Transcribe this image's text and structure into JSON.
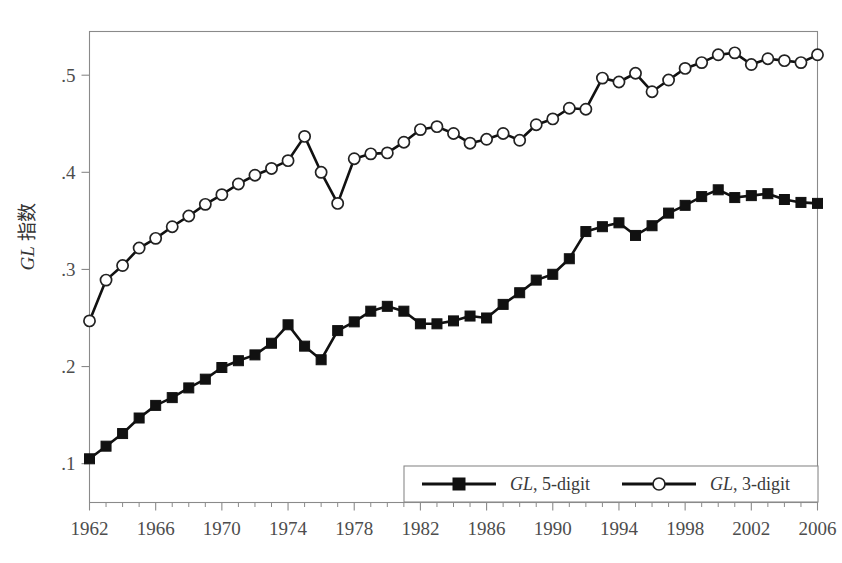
{
  "chart_data": {
    "type": "line",
    "title": "",
    "subtitle": "",
    "xlabel": "",
    "ylabel": "GL 指数",
    "ylabel_parts": {
      "italic": "GL",
      "plain": " 指数"
    },
    "xlim": [
      1962,
      2006
    ],
    "ylim": [
      0.06,
      0.545
    ],
    "grid": false,
    "legend_position": "bottom-right",
    "x_tick_labels": [
      "1962",
      "1966",
      "1970",
      "1974",
      "1978",
      "1982",
      "1986",
      "1990",
      "1994",
      "1998",
      "2002",
      "2006"
    ],
    "x_tick_values": [
      1962,
      1966,
      1970,
      1974,
      1978,
      1982,
      1986,
      1990,
      1994,
      1998,
      2002,
      2006
    ],
    "x_minor_step": 1,
    "y_tick_labels": [
      ".1",
      ".2",
      ".3",
      ".4",
      ".5"
    ],
    "y_tick_values": [
      0.1,
      0.2,
      0.3,
      0.4,
      0.5
    ],
    "x": [
      1962,
      1963,
      1964,
      1965,
      1966,
      1967,
      1968,
      1969,
      1970,
      1971,
      1972,
      1973,
      1974,
      1975,
      1976,
      1977,
      1978,
      1979,
      1980,
      1981,
      1982,
      1983,
      1984,
      1985,
      1986,
      1987,
      1988,
      1989,
      1990,
      1991,
      1992,
      1993,
      1994,
      1995,
      1996,
      1997,
      1998,
      1999,
      2000,
      2001,
      2002,
      2003,
      2004,
      2005,
      2006
    ],
    "series": [
      {
        "name": "GL, 5-digit",
        "marker": "filled-square",
        "color": "#111111",
        "values": [
          0.105,
          0.118,
          0.131,
          0.147,
          0.16,
          0.168,
          0.178,
          0.187,
          0.199,
          0.206,
          0.212,
          0.224,
          0.243,
          0.221,
          0.207,
          0.237,
          0.246,
          0.257,
          0.262,
          0.257,
          0.244,
          0.244,
          0.247,
          0.252,
          0.25,
          0.264,
          0.276,
          0.289,
          0.295,
          0.311,
          0.339,
          0.344,
          0.348,
          0.335,
          0.345,
          0.358,
          0.366,
          0.375,
          0.382,
          0.374,
          0.376,
          0.378,
          0.372,
          0.369,
          0.368
        ]
      },
      {
        "name": "GL, 3-digit",
        "marker": "open-circle",
        "color": "#111111",
        "values": [
          0.247,
          0.289,
          0.304,
          0.322,
          0.332,
          0.344,
          0.355,
          0.367,
          0.377,
          0.388,
          0.397,
          0.404,
          0.412,
          0.437,
          0.4,
          0.368,
          0.414,
          0.419,
          0.42,
          0.431,
          0.444,
          0.447,
          0.44,
          0.43,
          0.434,
          0.44,
          0.433,
          0.449,
          0.455,
          0.466,
          0.465,
          0.497,
          0.493,
          0.502,
          0.483,
          0.495,
          0.507,
          0.513,
          0.521,
          0.523,
          0.511,
          0.517,
          0.515,
          0.513,
          0.521
        ]
      }
    ],
    "legend": [
      {
        "label_italic": "GL",
        "label_rest": ", 5-digit",
        "marker": "filled-square"
      },
      {
        "label_italic": "GL",
        "label_rest": ", 3-digit",
        "marker": "open-circle"
      }
    ]
  },
  "axes": {
    "y_axis_title": "GL 指数"
  }
}
